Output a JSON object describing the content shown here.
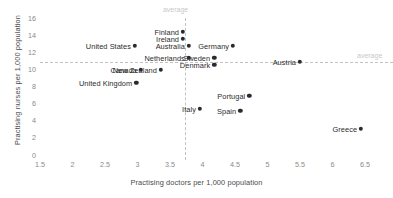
{
  "chart_data": {
    "type": "scatter",
    "title": "",
    "xlabel": "Practising doctors per 1,000 population",
    "ylabel": "Practising nurses per 1,000 population",
    "xlim": [
      1.5,
      6.5
    ],
    "ylim": [
      0,
      16
    ],
    "xticks": [
      "1.5",
      "2",
      "2.5",
      "3",
      "3.5",
      "4",
      "4.5",
      "5",
      "5.5",
      "6",
      "6.5"
    ],
    "yticks": [
      "0",
      "2",
      "4",
      "6",
      "8",
      "10",
      "12",
      "14",
      "16"
    ],
    "grid": false,
    "legend": "none",
    "point_color": "#2b2b2b",
    "reference_color": "#c2c2c2",
    "reference_lines": [
      {
        "orientation": "vertical",
        "value": 3.73,
        "label": "average",
        "label_position": "top"
      },
      {
        "orientation": "horizontal",
        "value": 10.9,
        "label": "average",
        "label_position": "right"
      }
    ],
    "points": [
      {
        "name": "Finland",
        "x": 3.7,
        "y": 14.4,
        "label_side": "left"
      },
      {
        "name": "Ireland",
        "x": 3.7,
        "y": 13.55,
        "label_side": "left"
      },
      {
        "name": "Australia",
        "x": 3.79,
        "y": 12.73,
        "label_side": "left"
      },
      {
        "name": "Germany",
        "x": 4.47,
        "y": 12.73,
        "label_side": "left"
      },
      {
        "name": "United States",
        "x": 2.96,
        "y": 12.73,
        "label_side": "left"
      },
      {
        "name": "Netherlands",
        "x": 3.79,
        "y": 11.33,
        "label_side": "left"
      },
      {
        "name": "Sweden",
        "x": 4.18,
        "y": 11.33,
        "label_side": "left"
      },
      {
        "name": "Denmark",
        "x": 4.18,
        "y": 10.51,
        "label_side": "left"
      },
      {
        "name": "Austria",
        "x": 5.5,
        "y": 10.86,
        "label_side": "left"
      },
      {
        "name": "New Zealand",
        "x": 3.36,
        "y": 9.93,
        "label_side": "left"
      },
      {
        "name": "Canada",
        "x": 3.05,
        "y": 9.93,
        "label_side": "left"
      },
      {
        "name": "United Kingdom",
        "x": 2.98,
        "y": 8.41,
        "label_side": "left"
      },
      {
        "name": "Portugal",
        "x": 4.72,
        "y": 6.89,
        "label_side": "left"
      },
      {
        "name": "Italy",
        "x": 3.96,
        "y": 5.37,
        "label_side": "left"
      },
      {
        "name": "Spain",
        "x": 4.58,
        "y": 5.14,
        "label_side": "left"
      },
      {
        "name": "Greece",
        "x": 6.44,
        "y": 3.04,
        "label_side": "left"
      }
    ]
  }
}
